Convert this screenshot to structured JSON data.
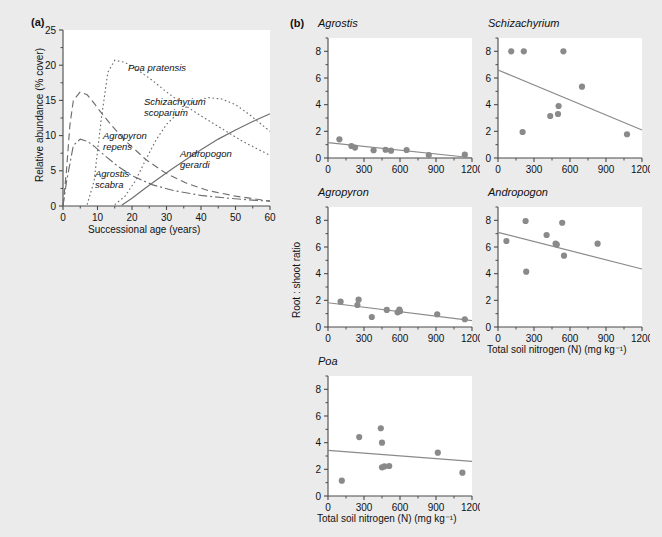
{
  "figure": {
    "background_color": "#ebebeb",
    "plot_background_color": "#ffffff",
    "marker_color": "#8a8a8a",
    "axis_color": "#4a4a4a"
  },
  "panel_a": {
    "tag": "(a)",
    "xlabel": "Successional age (years)",
    "ylabel": "Relative abundance (% cover)",
    "curve_labels": [
      {
        "name": "poa-pratensis",
        "line1": "Poa pratensis",
        "line2": ""
      },
      {
        "name": "schizachyrium-scoparium",
        "line1": "Schizachyrium",
        "line2": "scoparium"
      },
      {
        "name": "agropyron-repens",
        "line1": "Agropyron",
        "line2": "repens"
      },
      {
        "name": "agrostis-scabra",
        "line1": "Agrostis",
        "line2": "scabra"
      },
      {
        "name": "andropogon-gerardi",
        "line1": "Andropogon",
        "line2": "gerardi"
      }
    ],
    "xticks": [
      "0",
      "10",
      "20",
      "30",
      "40",
      "50",
      "60"
    ],
    "yticks": [
      "0",
      "5",
      "10",
      "15",
      "20",
      "25"
    ]
  },
  "panel_b": {
    "tag": "(b)",
    "xlabel": "Total soil nitrogen (N) (mg kg⁻¹)",
    "ylabel": "Root : shoot ratio",
    "xticks": [
      "0",
      "300",
      "600",
      "900",
      "1200"
    ],
    "yticks": [
      "0",
      "2",
      "4",
      "6",
      "8"
    ]
  },
  "chart_data": [
    {
      "type": "line",
      "name": "successional-abundance",
      "title": "(a)",
      "xlabel": "Successional age (years)",
      "ylabel": "Relative abundance (% cover)",
      "xlim": [
        0,
        60
      ],
      "ylim": [
        0,
        25
      ],
      "grid": false,
      "legend": "inline-labels",
      "series": [
        {
          "name": "Agrostis scabra",
          "style": "dashed",
          "x": [
            0,
            1,
            2,
            3,
            5,
            7,
            9,
            11,
            14,
            18,
            24,
            30,
            36,
            42,
            50,
            60
          ],
          "y": [
            0,
            5.0,
            11.5,
            15.0,
            16.2,
            15.8,
            14.6,
            13.3,
            11.5,
            9.3,
            6.6,
            4.6,
            3.2,
            2.2,
            1.4,
            0.7
          ]
        },
        {
          "name": "Agropyron repens",
          "style": "dash-dot",
          "x": [
            0,
            1,
            3,
            5,
            7,
            9,
            12,
            16,
            20,
            26,
            32,
            40,
            48,
            56,
            60
          ],
          "y": [
            0,
            3.4,
            8.6,
            9.5,
            9.2,
            8.5,
            7.2,
            5.6,
            4.3,
            3.0,
            2.2,
            1.5,
            1.1,
            0.8,
            0.7
          ]
        },
        {
          "name": "Poa pratensis",
          "style": "dotted",
          "x": [
            7,
            9,
            11,
            13,
            15,
            18,
            22,
            26,
            30,
            35,
            40,
            46,
            52,
            58,
            60
          ],
          "y": [
            0.2,
            3.5,
            12.0,
            19.0,
            20.7,
            20.4,
            19.2,
            17.8,
            16.2,
            14.4,
            12.8,
            11.0,
            9.2,
            7.7,
            7.2
          ]
        },
        {
          "name": "Schizachyrium scoparium",
          "style": "dotted",
          "x": [
            15,
            18,
            21,
            24,
            27,
            30,
            34,
            38,
            42,
            46,
            50,
            54,
            58,
            60
          ],
          "y": [
            0.2,
            1.4,
            3.6,
            6.6,
            9.4,
            11.6,
            13.5,
            14.8,
            15.4,
            15.2,
            14.4,
            13.0,
            11.4,
            10.6
          ]
        },
        {
          "name": "Andropogon gerardi",
          "style": "solid",
          "x": [
            17,
            20,
            24,
            28,
            32,
            36,
            40,
            45,
            50,
            55,
            60
          ],
          "y": [
            0.1,
            1.1,
            2.6,
            4.0,
            5.4,
            6.7,
            8.0,
            9.5,
            10.8,
            12.0,
            13.1
          ]
        }
      ]
    },
    {
      "type": "scatter",
      "name": "agrostis",
      "title": "Agrostis",
      "xlabel": "",
      "ylabel": "Root : shoot ratio",
      "xlim": [
        0,
        1200
      ],
      "ylim": [
        0,
        9
      ],
      "points": [
        [
          95,
          1.4
        ],
        [
          195,
          0.9
        ],
        [
          225,
          0.78
        ],
        [
          380,
          0.58
        ],
        [
          480,
          0.62
        ],
        [
          525,
          0.55
        ],
        [
          655,
          0.6
        ],
        [
          840,
          0.22
        ],
        [
          1140,
          0.25
        ]
      ],
      "fit": {
        "x0": 0,
        "y0": 1.15,
        "x1": 1200,
        "y1": 0.02
      }
    },
    {
      "type": "scatter",
      "name": "schizachyrium",
      "title": "Schizachyrium",
      "xlabel": "",
      "ylabel": "",
      "xlim": [
        0,
        1200
      ],
      "ylim": [
        0,
        9
      ],
      "points": [
        [
          110,
          8.0
        ],
        [
          215,
          8.0
        ],
        [
          545,
          8.0
        ],
        [
          205,
          1.95
        ],
        [
          435,
          3.15
        ],
        [
          500,
          3.3
        ],
        [
          505,
          3.9
        ],
        [
          700,
          5.35
        ],
        [
          1075,
          1.78
        ]
      ],
      "fit": {
        "x0": 0,
        "y0": 6.6,
        "x1": 1200,
        "y1": 2.1
      }
    },
    {
      "type": "scatter",
      "name": "agropyron",
      "title": "Agropyron",
      "xlabel": "",
      "ylabel": "Root : shoot ratio",
      "xlim": [
        0,
        1200
      ],
      "ylim": [
        0,
        9
      ],
      "points": [
        [
          105,
          1.9
        ],
        [
          245,
          1.65
        ],
        [
          255,
          2.05
        ],
        [
          365,
          0.75
        ],
        [
          490,
          1.28
        ],
        [
          580,
          1.1
        ],
        [
          595,
          1.3
        ],
        [
          600,
          1.18
        ],
        [
          910,
          0.95
        ],
        [
          1140,
          0.58
        ]
      ],
      "fit": {
        "x0": 0,
        "y0": 1.82,
        "x1": 1200,
        "y1": 0.48
      }
    },
    {
      "type": "scatter",
      "name": "andropogon",
      "title": "Andropogon",
      "xlabel": "Total soil nitrogen (N) (mg kg⁻¹)",
      "ylabel": "",
      "xlim": [
        0,
        1200
      ],
      "ylim": [
        0,
        9
      ],
      "points": [
        [
          70,
          6.45
        ],
        [
          230,
          7.95
        ],
        [
          235,
          4.15
        ],
        [
          405,
          6.9
        ],
        [
          480,
          6.25
        ],
        [
          490,
          6.18
        ],
        [
          535,
          7.82
        ],
        [
          550,
          5.35
        ],
        [
          830,
          6.25
        ]
      ],
      "fit": {
        "x0": 0,
        "y0": 7.1,
        "x1": 1200,
        "y1": 4.35
      }
    },
    {
      "type": "scatter",
      "name": "poa",
      "title": "Poa",
      "xlabel": "Total soil nitrogen (N) (mg kg⁻¹)",
      "ylabel": "",
      "xlim": [
        0,
        1200
      ],
      "ylim": [
        0,
        9
      ],
      "points": [
        [
          115,
          1.15
        ],
        [
          260,
          4.42
        ],
        [
          440,
          5.08
        ],
        [
          450,
          4.0
        ],
        [
          450,
          2.15
        ],
        [
          470,
          2.22
        ],
        [
          510,
          2.25
        ],
        [
          915,
          3.25
        ],
        [
          1120,
          1.75
        ]
      ],
      "fit": {
        "x0": 0,
        "y0": 3.42,
        "x1": 1200,
        "y1": 2.6
      }
    }
  ]
}
